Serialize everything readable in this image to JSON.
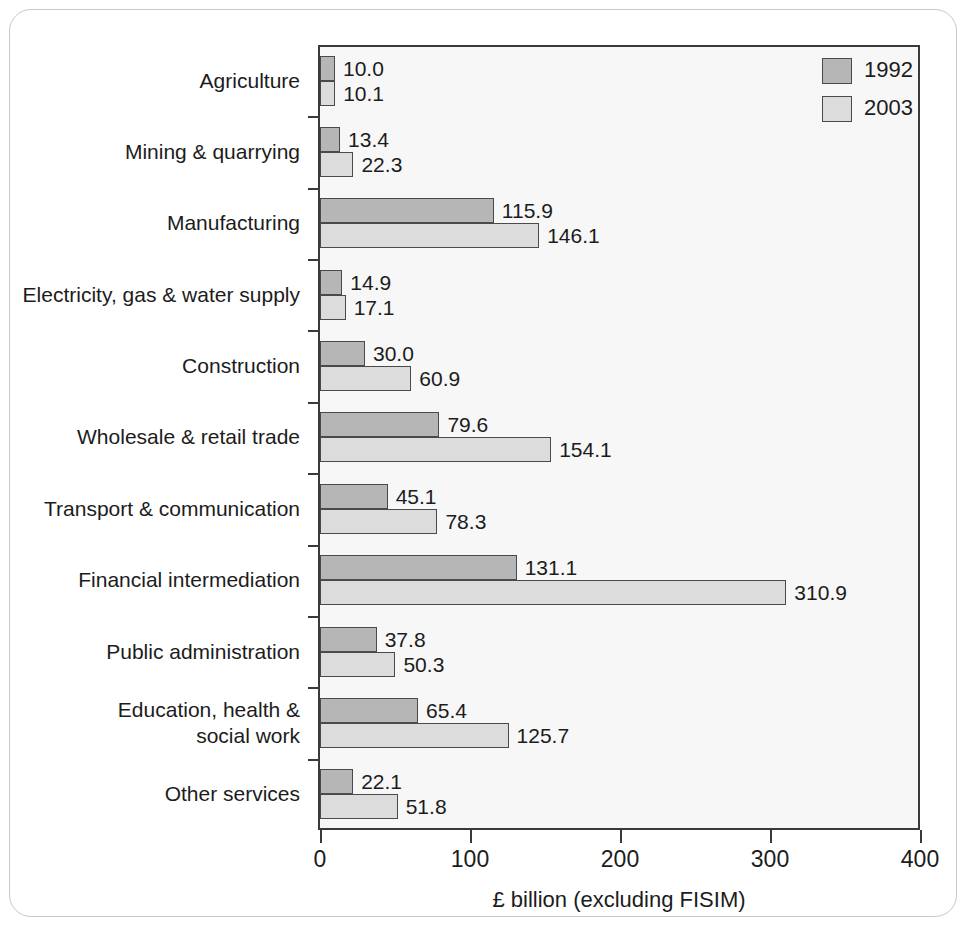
{
  "chart_data": {
    "type": "bar",
    "orientation": "horizontal",
    "title": "",
    "xlabel": "£ billion (excluding FISIM)",
    "ylabel": "",
    "xlim": [
      0,
      400
    ],
    "xticks": [
      "0",
      "100",
      "200",
      "300",
      "400"
    ],
    "grid": false,
    "legend_position": "top-right",
    "categories": [
      "Agriculture",
      "Mining & quarrying",
      "Manufacturing",
      "Electricity, gas & water supply",
      "Construction",
      "Wholesale & retail trade",
      "Transport & communication",
      "Financial intermediation",
      "Public administration",
      "Education, health & social work",
      "Other services"
    ],
    "series": [
      {
        "name": "1992",
        "color": "#b6b6b6",
        "values": [
          10.0,
          13.4,
          115.9,
          14.9,
          30.0,
          79.6,
          45.1,
          131.1,
          37.8,
          65.4,
          22.1
        ],
        "labels": [
          "10.0",
          "13.4",
          "115.9",
          "14.9",
          "30.0",
          "79.6",
          "45.1",
          "131.1",
          "37.8",
          "65.4",
          "22.1"
        ]
      },
      {
        "name": "2003",
        "color": "#dcdcdc",
        "values": [
          10.1,
          22.3,
          146.1,
          17.1,
          60.9,
          154.1,
          78.3,
          310.9,
          50.3,
          125.7,
          51.8
        ],
        "labels": [
          "10.1",
          "22.3",
          "146.1",
          "17.1",
          "60.9",
          "154.1",
          "78.3",
          "310.9",
          "50.3",
          "125.7",
          "51.8"
        ]
      }
    ]
  },
  "legend": {
    "entries": [
      {
        "label": "1992",
        "swatch": "swatch-1992"
      },
      {
        "label": "2003",
        "swatch": "swatch-2003"
      }
    ]
  },
  "category_label_lines": [
    [
      "Agriculture"
    ],
    [
      "Mining & quarrying"
    ],
    [
      "Manufacturing"
    ],
    [
      "Electricity, gas & water supply"
    ],
    [
      "Construction"
    ],
    [
      "Wholesale & retail trade"
    ],
    [
      "Transport & communication"
    ],
    [
      "Financial intermediation"
    ],
    [
      "Public administration"
    ],
    [
      "Education, health &",
      "social work"
    ],
    [
      "Other services"
    ]
  ]
}
